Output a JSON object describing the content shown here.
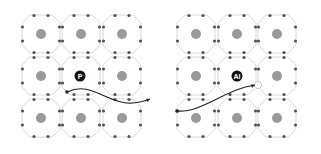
{
  "diagram": {
    "panels": [
      {
        "id": "left",
        "label": "P",
        "label_pos": [
          80,
          76
        ],
        "cells": {
          "cols": [
            41,
            81,
            122
          ],
          "rows": [
            34,
            76,
            118
          ]
        },
        "arrow": {
          "from": [
            67,
            92
          ],
          "to": [
            150,
            99
          ]
        },
        "vacancy": null
      },
      {
        "id": "right",
        "label": "Al",
        "label_pos": [
          237,
          76
        ],
        "cells": {
          "cols": [
            196,
            237,
            277
          ],
          "rows": [
            34,
            76,
            118
          ]
        },
        "arrow": {
          "from": [
            177,
            111
          ],
          "to": [
            255,
            85
          ]
        },
        "vacancy": [
          258,
          85
        ]
      }
    ],
    "colors": {
      "center_atom": "#9a9a9a",
      "edge_atom": "#555555",
      "bond": "#d0d0d0",
      "label_bg": "#111111",
      "label_text": "#ffffff",
      "arrow": "#222222"
    }
  }
}
